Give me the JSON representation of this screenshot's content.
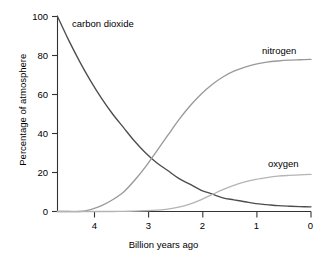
{
  "chart_data": {
    "type": "line",
    "title": "",
    "xlabel": "Billion years ago",
    "ylabel": "Percentage of atmosphere",
    "xlim": [
      4.6,
      0
    ],
    "ylim": [
      0,
      100
    ],
    "x_reversed": true,
    "grid": false,
    "legend_position": "inline-curve-labels",
    "xticks": [
      "4",
      "3",
      "2",
      "1",
      "0"
    ],
    "xtick_values": [
      4,
      3,
      2,
      1,
      0
    ],
    "yticks": [
      "0",
      "20",
      "40",
      "60",
      "80",
      "100"
    ],
    "ytick_values": [
      0,
      20,
      40,
      60,
      80,
      100
    ],
    "x": [
      4.6,
      4.4,
      4.2,
      4.0,
      3.8,
      3.6,
      3.4,
      3.2,
      3.0,
      2.8,
      2.6,
      2.4,
      2.2,
      2.0,
      1.8,
      1.6,
      1.4,
      1.2,
      1.0,
      0.8,
      0.6,
      0.4,
      0.2,
      0.0
    ],
    "series": [
      {
        "name": "carbon dioxide",
        "label": "carbon dioxide",
        "color": "#4d4d4d",
        "values": [
          100,
          88,
          77,
          67,
          58,
          50,
          43,
          36,
          30,
          25,
          21,
          17,
          14,
          11,
          9,
          7,
          6,
          5,
          4,
          3.5,
          3,
          2.7,
          2.5,
          2.4
        ]
      },
      {
        "name": "nitrogen",
        "label": "nitrogen",
        "color": "#9a9a9a",
        "values": [
          0,
          0,
          0,
          1,
          3,
          6,
          10,
          16,
          23,
          31,
          39,
          47,
          54,
          60,
          65,
          69,
          72,
          74,
          75.6,
          76.6,
          77.2,
          77.6,
          77.8,
          78
        ]
      },
      {
        "name": "oxygen",
        "label": "oxygen",
        "color": "#b4b4b4",
        "values": [
          0,
          0,
          0,
          0,
          0,
          0,
          0.1,
          0.2,
          0.4,
          0.7,
          1.2,
          2.2,
          3.8,
          6.0,
          8.6,
          11.2,
          13.4,
          15.2,
          16.5,
          17.4,
          18.1,
          18.5,
          18.8,
          19.0
        ]
      }
    ],
    "annotations": [
      {
        "text": "carbon dioxide",
        "x": 3.85,
        "y": 96
      },
      {
        "text": "nitrogen",
        "x": 0.75,
        "y": 83
      },
      {
        "text": "oxygen",
        "x": 0.65,
        "y": 25
      }
    ]
  },
  "axes": {
    "y_title": "Percentage of atmosphere",
    "x_title": "Billion years ago",
    "y_labels": {
      "t0": "0",
      "t20": "20",
      "t40": "40",
      "t60": "60",
      "t80": "80",
      "t100": "100"
    },
    "x_labels": {
      "t4": "4",
      "t3": "3",
      "t2": "2",
      "t1": "1",
      "t0": "0"
    }
  },
  "labels": {
    "carbon_dioxide": "carbon dioxide",
    "nitrogen": "nitrogen",
    "oxygen": "oxygen"
  },
  "colors": {
    "axis": "#333333",
    "carbon_dioxide": "#4d4d4d",
    "nitrogen": "#9a9a9a",
    "oxygen": "#b4b4b4",
    "background": "#ffffff",
    "text": "#000000"
  }
}
